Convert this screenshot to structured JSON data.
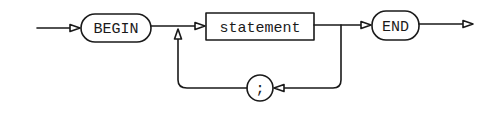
{
  "diagram": {
    "type": "syntax-diagram",
    "nodes": {
      "begin": {
        "label": "BEGIN",
        "kind": "terminal"
      },
      "statement": {
        "label": "statement",
        "kind": "nonterminal"
      },
      "end": {
        "label": "END",
        "kind": "terminal"
      },
      "separator": {
        "label": ";",
        "kind": "terminal"
      }
    },
    "colors": {
      "stroke": "#1a1a1a",
      "background": "#ffffff"
    }
  }
}
